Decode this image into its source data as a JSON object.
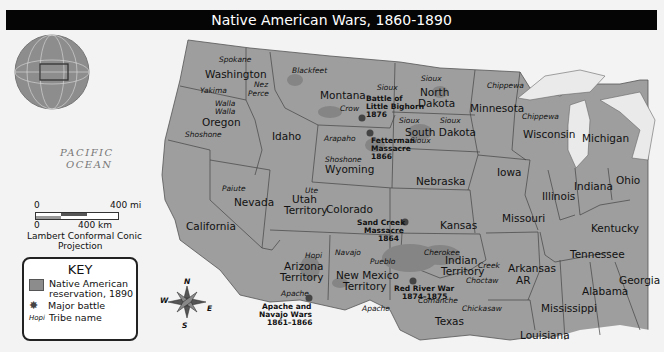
{
  "title": "Native American Wars, 1860-1890",
  "ocean_label": [
    "PACIFIC",
    "OCEAN"
  ],
  "scale": {
    "mi_zero": "0",
    "mi_label": "400 mi",
    "km_zero": "0",
    "km_label": "400 km",
    "projection_line1": "Lambert Conformal Conic",
    "projection_line2": "Projection"
  },
  "key": {
    "title": "KEY",
    "reservation_label_line1": "Native American",
    "reservation_label_line2": "reservation, 1890",
    "battle_label": "Major battle",
    "tribe_sample": "Hopi",
    "tribe_label": "Tribe name"
  },
  "compass": {
    "n": "N",
    "s": "S",
    "e": "E",
    "w": "W"
  },
  "states": {
    "washington": "Washington",
    "oregon": "Oregon",
    "california": "California",
    "idaho": "Idaho",
    "nevada": "Nevada",
    "montana": "Montana",
    "wyoming": "Wyoming",
    "utah1": "Utah",
    "utah2": "Territory",
    "colorado": "Colorado",
    "arizona1": "Arizona",
    "arizona2": "Territory",
    "newmexico1": "New Mexico",
    "newmexico2": "Territory",
    "northdakota1": "North",
    "northdakota2": "Dakota",
    "southdakota": "South Dakota",
    "nebraska": "Nebraska",
    "kansas": "Kansas",
    "indian1": "Indian",
    "indian2": "Territory",
    "texas": "Texas",
    "minnesota": "Minnesota",
    "iowa": "Iowa",
    "missouri": "Missouri",
    "arkansas": "Arkansas",
    "ar": "AR",
    "louisiana": "Louisiana",
    "wisconsin": "Wisconsin",
    "illinois": "Illinois",
    "michigan": "Michigan",
    "indiana": "Indiana",
    "ohio": "Ohio",
    "kentucky": "Kentucky",
    "tennessee": "Tennessee",
    "mississippi": "Mississippi",
    "alabama": "Alabama",
    "georgia": "Georgia"
  },
  "tribes": {
    "spokane": "Spokane",
    "yakima": "Yakima",
    "nez1": "Nez",
    "nez2": "Perce",
    "walla1": "Walla",
    "walla2": "Walla",
    "shoshone_or": "Shoshone",
    "blackfeet": "Blackfeet",
    "crow": "Crow",
    "sioux_mt": "Sioux",
    "sioux_nd": "Sioux",
    "sioux_sd1": "Sioux",
    "sioux_sd2": "Sioux",
    "sioux_sd3": "Sioux",
    "arapaho": "Arapaho",
    "shoshone_wy": "Shoshone",
    "paiute": "Paiute",
    "ute": "Ute",
    "hopi": "Hopi",
    "navajo": "Navajo",
    "pueblo": "Pueblo",
    "apache_az": "Apache",
    "apache_nm": "Apache",
    "cherokee": "Cherokee",
    "creek": "Creek",
    "choctaw": "Choctaw",
    "comanche": "Comanche",
    "chickasaw": "Chickasaw",
    "chippewa_mn": "Chippewa",
    "chippewa_wi": "Chippewa"
  },
  "battles": {
    "bighorn": [
      "Battle of",
      "Little Bighorn",
      "1876"
    ],
    "fetterman": [
      "Fetterman",
      "Massacre",
      "1866"
    ],
    "sandcreek": [
      "Sand Creek",
      "Massacre",
      "1864"
    ],
    "redriver": [
      "Red River War",
      "1874–1875"
    ],
    "apache": [
      "Apache and",
      "Navajo Wars",
      "1861–1866"
    ]
  }
}
